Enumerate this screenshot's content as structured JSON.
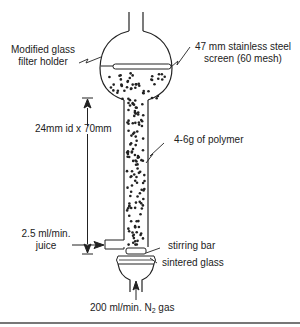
{
  "labels": {
    "filter_holder": [
      "Modified glass",
      "filter holder"
    ],
    "screen": [
      "47 mm stainless steel",
      "screen (60 mesh)"
    ],
    "dimension": "24mm id x 70mm",
    "polymer": "4-6g of polymer",
    "juice_rate": [
      "2.5 ml/min.",
      "juice"
    ],
    "stirring_bar": "stirring bar",
    "sintered_glass": "sintered glass",
    "gas_prefix": "200 ml/min. N",
    "gas_subscript": "2",
    "gas_suffix": " gas"
  },
  "colors": {
    "line": "#222222",
    "rule": "#777777"
  }
}
